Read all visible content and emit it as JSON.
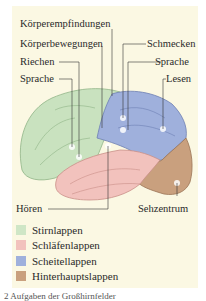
{
  "diagram": {
    "labels": {
      "koerperempfindungen": "Körperempfindungen",
      "koerperbewegungen": "Körperbewegungen",
      "riechen": "Riechen",
      "sprache_left": "Sprache",
      "schmecken": "Schmecken",
      "sprache_right": "Sprache",
      "lesen": "Lesen",
      "hoeren": "Hören",
      "sehzentrum": "Sehzentrum"
    },
    "legend": [
      {
        "label": "Stirnlappen",
        "color": "#cfe6c6"
      },
      {
        "label": "Schläfenlappen",
        "color": "#f2c2bd"
      },
      {
        "label": "Scheitellappen",
        "color": "#9fb0dc"
      },
      {
        "label": "Hinterhauptslappen",
        "color": "#c9a07e"
      }
    ],
    "caption": "2 Aufgaben der Großhirnfelder"
  }
}
